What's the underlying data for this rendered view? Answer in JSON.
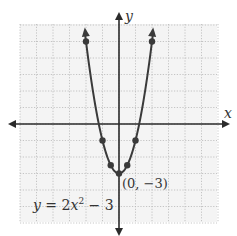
{
  "chart_data": {
    "type": "line",
    "title": "",
    "xlabel": "x",
    "ylabel": "y",
    "xlim": [
      -6,
      6
    ],
    "ylim": [
      -3,
      6
    ],
    "grid": true,
    "series": [
      {
        "name": "y = 2x^2 - 3",
        "function": "2*x^2 - 3",
        "points": [
          {
            "x": -2,
            "y": 5
          },
          {
            "x": -1,
            "y": -1
          },
          {
            "x": -0.5,
            "y": -2.5
          },
          {
            "x": 0,
            "y": -3
          },
          {
            "x": 0.5,
            "y": -2.5
          },
          {
            "x": 1,
            "y": -1
          },
          {
            "x": 2,
            "y": 5
          }
        ]
      }
    ],
    "annotations": [
      {
        "text": "(0, −3)",
        "x": 0,
        "y": -3
      },
      {
        "text": "y = 2x² − 3",
        "position": "lower-left"
      }
    ]
  },
  "labels": {
    "x_axis": "x",
    "y_axis": "y",
    "vertex": "(0, −3)",
    "equation_y": "y",
    "equation_eq": " = 2",
    "equation_x": "x",
    "equation_exp": "2",
    "equation_rest": " − 3"
  },
  "colors": {
    "curve": "#3a3a3a",
    "axis": "#2b2b2b",
    "grid": "#b8b8b8",
    "grid_bg": "#f4f4f4"
  }
}
